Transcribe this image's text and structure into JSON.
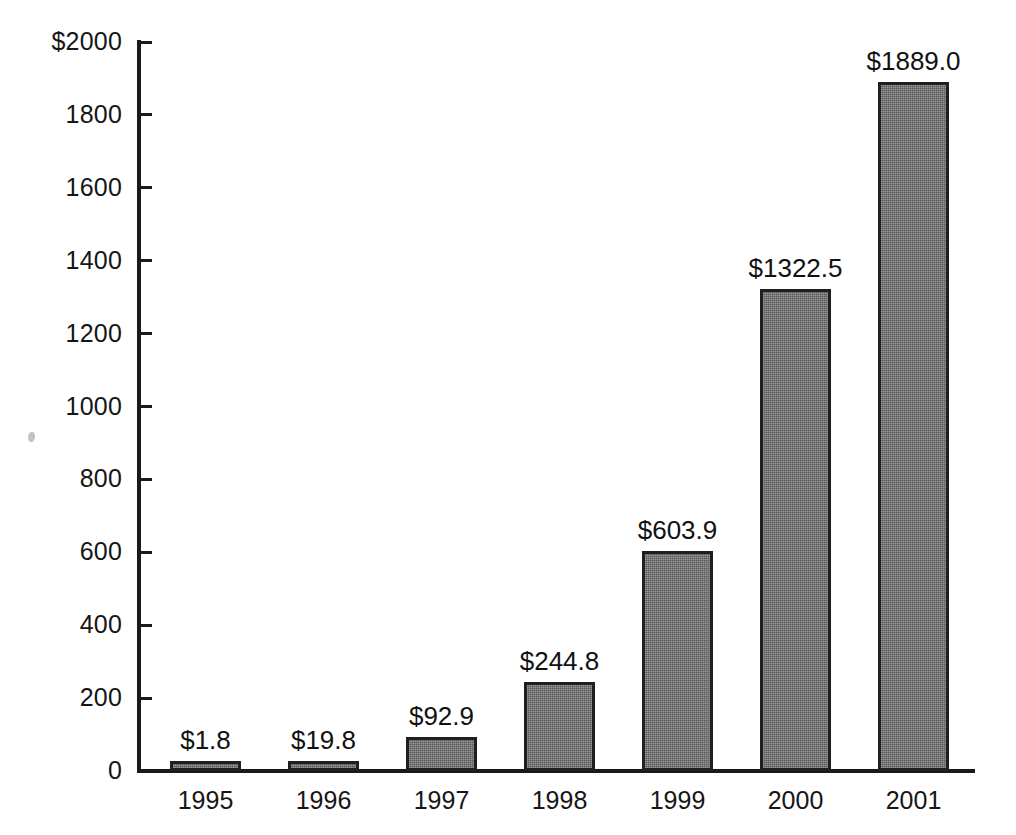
{
  "chart_data": {
    "type": "bar",
    "title": "",
    "xlabel": "",
    "ylabel": "",
    "categories": [
      "1995",
      "1996",
      "1997",
      "1998",
      "1999",
      "2000",
      "2001"
    ],
    "values": [
      1.8,
      19.8,
      92.9,
      244.8,
      603.9,
      1322.5,
      1889.0
    ],
    "data_labels": [
      "$1.8",
      "$19.8",
      "$92.9",
      "$244.8",
      "$603.9",
      "$1322.5",
      "$1889.0"
    ],
    "ylim": [
      0,
      2000
    ],
    "ytick_values": [
      0,
      200,
      400,
      600,
      800,
      1000,
      1200,
      1400,
      1600,
      1800,
      2000
    ],
    "ytick_labels": [
      "0",
      "200",
      "400",
      "600",
      "800",
      "1000",
      "1200",
      "1400",
      "1600",
      "1800",
      "$2000"
    ],
    "grid": false,
    "legend": null,
    "series_color": "#6d6d6d",
    "axis_color": "#1a1a1a",
    "background_color": "#ffffff"
  }
}
